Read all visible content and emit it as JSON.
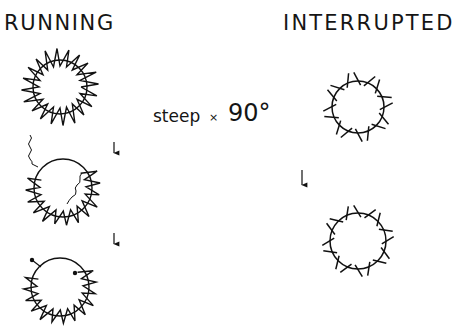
{
  "titles": {
    "left": "RUNNING",
    "right": "INTERRUPTED"
  },
  "condition": {
    "label": "steep",
    "operator": "×",
    "angle": "90°"
  },
  "panels": {
    "running": {
      "stages": [
        {
          "name": "intact-spiked-ring",
          "features": [
            "zigzag spikes all around circle"
          ]
        },
        {
          "name": "ring-with-fibers",
          "features": [
            "partial zigzag spikes",
            "wavy fiber outside top-left",
            "wavy fiber inside right"
          ]
        },
        {
          "name": "ring-with-dots",
          "features": [
            "partial zigzag spikes",
            "dot outside top-left",
            "dot inside top-right"
          ]
        }
      ],
      "arrows": 2
    },
    "interrupted": {
      "stages": [
        {
          "name": "ticked-ring-1",
          "features": [
            "short straight ticks around circle"
          ]
        },
        {
          "name": "ticked-ring-2",
          "features": [
            "short straight ticks around circle"
          ]
        }
      ],
      "arrows": 1
    }
  },
  "colors": {
    "ink": "#111111",
    "background": "#ffffff"
  }
}
